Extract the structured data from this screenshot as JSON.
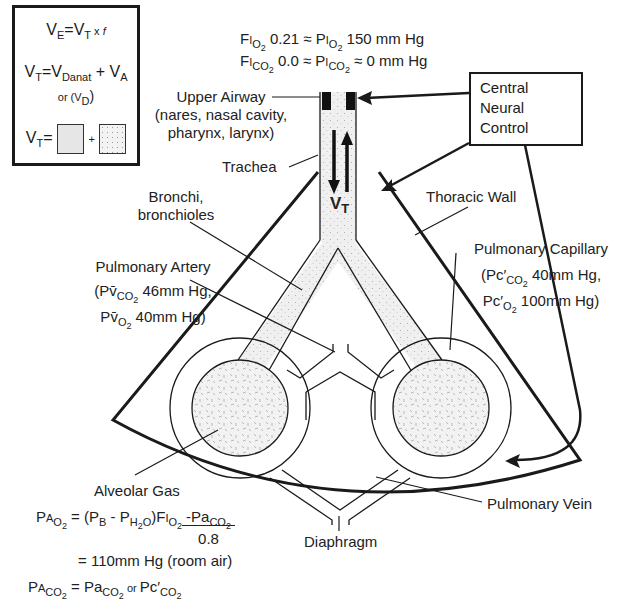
{
  "formula_box": {
    "ve_eq": {
      "lhs": "V",
      "lhs_sub": "E",
      "eq": "=V",
      "rhs_sub": "T",
      "rest": " x ",
      "f": "f"
    },
    "vt_eq": {
      "lhs": "V",
      "lhs_sub": "T",
      "eq": "=V",
      "d_sub": "D",
      "d_subsub": "anat",
      "plus": " + V",
      "a_sub": "A"
    },
    "or_vd": {
      "text": "or (V",
      "sub": "D",
      "close": ")"
    },
    "vt_squares": {
      "lhs": "V",
      "lhs_sub": "T",
      "eq": "=",
      "plus": "+"
    }
  },
  "inspired_gas": {
    "line1": {
      "f": "F",
      "i": "I",
      "sub": "O",
      "subsub": "2",
      "val": " 0.21 ≈ P",
      "i2": "I",
      "sub2": "O",
      "subsub2": "2",
      "rest": " 150 mm Hg"
    },
    "line2": {
      "f": "F",
      "i": "I",
      "sub": "CO",
      "subsub": "2",
      "val": " 0.0 ≈ P",
      "i2": "I",
      "sub2": "CO",
      "subsub2": "2",
      "rest": " ≈ 0 mm Hg"
    }
  },
  "central_neural_control": {
    "lines": [
      "Central",
      "Neural",
      "Control"
    ]
  },
  "labels": {
    "upper_airway": [
      "Upper Airway",
      "(nares, nasal cavity,",
      "pharynx, larynx)"
    ],
    "trachea": "Trachea",
    "bronchi": [
      "Bronchi,",
      "bronchioles"
    ],
    "tidal_volume": {
      "v": "V",
      "sub": "T"
    },
    "thoracic_wall": "Thoracic Wall",
    "pulmonary_artery": {
      "title": "Pulmonary Artery",
      "line2": {
        "open": "(P",
        "vbar": "v̄",
        "sub": "CO",
        "subsub": "2",
        "val": " 46mm Hg,"
      },
      "line3": {
        "p": "P",
        "vbar": "v̄",
        "sub": "O",
        "subsub": "2",
        "val": " 40mm Hg)"
      }
    },
    "pulmonary_capillary": {
      "title": "Pulmonary Capillary",
      "line2": {
        "open": "(Pc′",
        "sub": "CO",
        "subsub": "2",
        "val": " 40mm Hg,"
      },
      "line3": {
        "p": "Pc′",
        "sub": "O",
        "subsub": "2",
        "val": " 100mm Hg)"
      }
    },
    "alveolar_gas": "Alveolar Gas",
    "pulmonary_vein": "Pulmonary Vein",
    "diaphragm": "Diaphragm"
  },
  "alveolar_equations": {
    "pao2": {
      "p": "P",
      "a": "A",
      "sub": "O",
      "subsub": "2",
      "eq": " = (P",
      "b_sub": "B",
      "minus": " - P",
      "h2o_sub": "H",
      "h2o_subsub": "2",
      "h2o_o": "O",
      "close": ")F",
      "i": "I",
      "fi_sub": "O",
      "fi_subsub": "2",
      "dash": "-P",
      "a2": "a",
      "paco2_sub": "CO",
      "paco2_subsub": "2",
      "denominator": "0.8"
    },
    "result": "= 110mm Hg (room air)",
    "paco2": {
      "p": "P",
      "a": "A",
      "sub": "CO",
      "subsub": "2",
      "eq": " = P",
      "a2": "a",
      "sub2": "CO",
      "subsub2": "2",
      "or": " or ",
      "pc": "Pc′",
      "sub3": "CO",
      "subsub3": "2"
    }
  },
  "colors": {
    "line": "#1a1a1a",
    "stipple_fill": "#e8e8e8",
    "background": "#ffffff"
  }
}
